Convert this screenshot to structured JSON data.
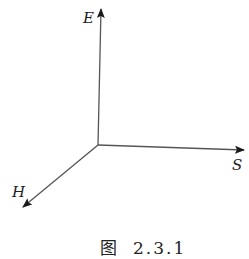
{
  "diagram": {
    "type": "3d-axis-vectors",
    "origin": [
      98,
      145
    ],
    "axes": [
      {
        "name": "E",
        "label": "E",
        "direction": "up",
        "tip": [
          101,
          8
        ]
      },
      {
        "name": "S",
        "label": "S",
        "direction": "right",
        "tip": [
          245,
          150
        ]
      },
      {
        "name": "H",
        "label": "H",
        "direction": "down-left",
        "tip": [
          22,
          208
        ]
      }
    ],
    "line_color": "#555555",
    "arrow_color": "#1a1a1a"
  },
  "caption": {
    "prefix": "图",
    "number": "2.3.1"
  }
}
